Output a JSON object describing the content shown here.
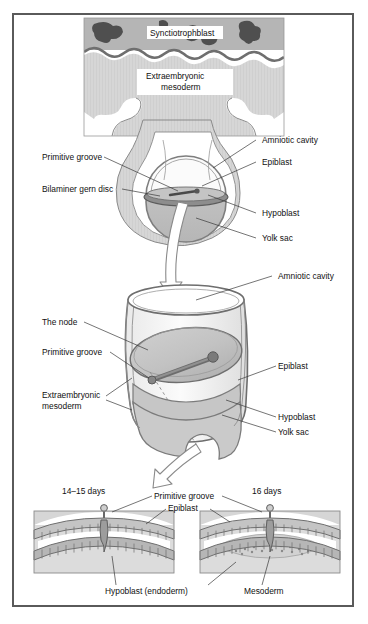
{
  "figure": {
    "frame_color": "#5a5a5a",
    "background": "#ffffff"
  },
  "palette": {
    "light_gray": "#d9d9d9",
    "mid_gray": "#bdbdbd",
    "dark_gray": "#8c8c8c",
    "outline_gray": "#7d7d7d",
    "very_dark": "#4a4a4a",
    "near_black": "#3c3c3c",
    "white": "#ffffff",
    "text": "#111111"
  },
  "panels": {
    "top": {
      "name": "implantation-site-panel",
      "labels": [
        {
          "id": "syncytiotrophoblast",
          "text": "Synctiotrophblast",
          "boxed": true
        },
        {
          "id": "extraembryonic-mesoderm",
          "text": "Extraembryonic\nmesoderm",
          "boxed": true,
          "line1": "Extraembryonic",
          "line2": "mesoderm"
        }
      ]
    },
    "upper_embryo": {
      "name": "bilaminar-disc-panel",
      "labels_left": [
        {
          "id": "primitive-groove",
          "text": "Primitive groove"
        },
        {
          "id": "bilaminar-germ-disc",
          "text": "Bilaminer gern disc"
        }
      ],
      "labels_right": [
        {
          "id": "amniotic-cavity",
          "text": "Amniotic cavity"
        },
        {
          "id": "epiblast",
          "text": "Epiblast"
        },
        {
          "id": "hypoblast",
          "text": "Hypoblast"
        },
        {
          "id": "yolk-sac",
          "text": "Yolk sac"
        }
      ]
    },
    "middle_cylinder": {
      "name": "embryonic-disc-cutaway-panel",
      "labels_left": [
        {
          "id": "the-node",
          "text": "The node"
        },
        {
          "id": "primitive-groove",
          "text": "Primitive groove"
        },
        {
          "id": "extraembryonic-mesoderm",
          "text": "Extraembryonic\nmesoderm",
          "line1": "Extraembryonic",
          "line2": "mesoderm"
        }
      ],
      "labels_right": [
        {
          "id": "amniotic-cavity",
          "text": "Amniotic cavity"
        },
        {
          "id": "epiblast",
          "text": "Epiblast"
        },
        {
          "id": "hypoblast",
          "text": "Hypoblast"
        },
        {
          "id": "yolk-sac",
          "text": "Yolk sac"
        }
      ]
    },
    "bottom": {
      "name": "cross-section-panel",
      "left_section": {
        "name": "section-14-15-days",
        "stage_label": "14–15 days"
      },
      "right_section": {
        "name": "section-16-days",
        "stage_label": "16 days"
      },
      "shared_labels": [
        {
          "id": "primitive-groove",
          "text": "Primitive groove"
        },
        {
          "id": "epiblast",
          "text": "Epiblast"
        },
        {
          "id": "hypoblast-endoderm",
          "text": "Hypoblast (endoderm)"
        },
        {
          "id": "mesoderm",
          "text": "Mesoderm"
        }
      ]
    }
  },
  "arrows": [
    {
      "id": "arrow-top-to-middle",
      "direction": "down",
      "style": "hollow-white"
    },
    {
      "id": "arrow-middle-to-bottom",
      "direction": "down-left",
      "style": "hollow-white"
    }
  ]
}
